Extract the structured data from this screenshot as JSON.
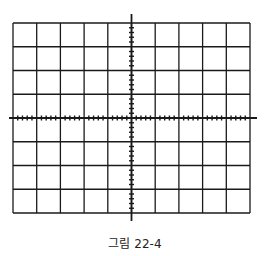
{
  "figure": {
    "type": "oscilloscope-graticule",
    "caption": "그림 22-4",
    "grid": {
      "columns": 10,
      "rows": 8,
      "minor_ticks_per_division": 5,
      "left": 13,
      "top": 23,
      "right": 250,
      "bottom": 213
    },
    "axes": {
      "center_x": 131.5,
      "center_y": 118,
      "h_axis_extent": [
        9,
        257
      ],
      "v_axis_extent": [
        14,
        221
      ]
    },
    "colors": {
      "line": "#1a1a1a",
      "background": "#ffffff"
    }
  }
}
